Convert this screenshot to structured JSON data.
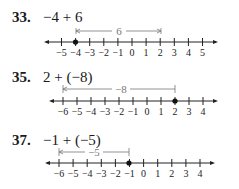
{
  "problems": [
    {
      "number": "33.",
      "expression": "−4 + 6",
      "number_line": {
        "ticks": [
          "−5",
          "−4",
          "−3",
          "−2",
          "−1",
          "0",
          "1",
          "2",
          "3",
          "4",
          "5"
        ],
        "start_value": -4,
        "end_value": 2,
        "move_label": "6",
        "dot_value": -4
      }
    },
    {
      "number": "35.",
      "expression": "2 + (−8)",
      "number_line": {
        "ticks": [
          "−6",
          "−5",
          "−4",
          "−3",
          "−2",
          "−1",
          "0",
          "1",
          "2",
          "3",
          "4"
        ],
        "start_value": -6,
        "end_value": 2,
        "move_label": "−8",
        "dot_value": 2
      }
    },
    {
      "number": "37.",
      "expression": "−1 + (−5)",
      "number_line": {
        "ticks": [
          "−6",
          "−5",
          "−4",
          "−3",
          "−2",
          "−1",
          "0",
          "1",
          "2",
          "3",
          "4"
        ],
        "start_value": -6,
        "end_value": -1,
        "move_label": "−5",
        "dot_value": -1
      }
    }
  ]
}
